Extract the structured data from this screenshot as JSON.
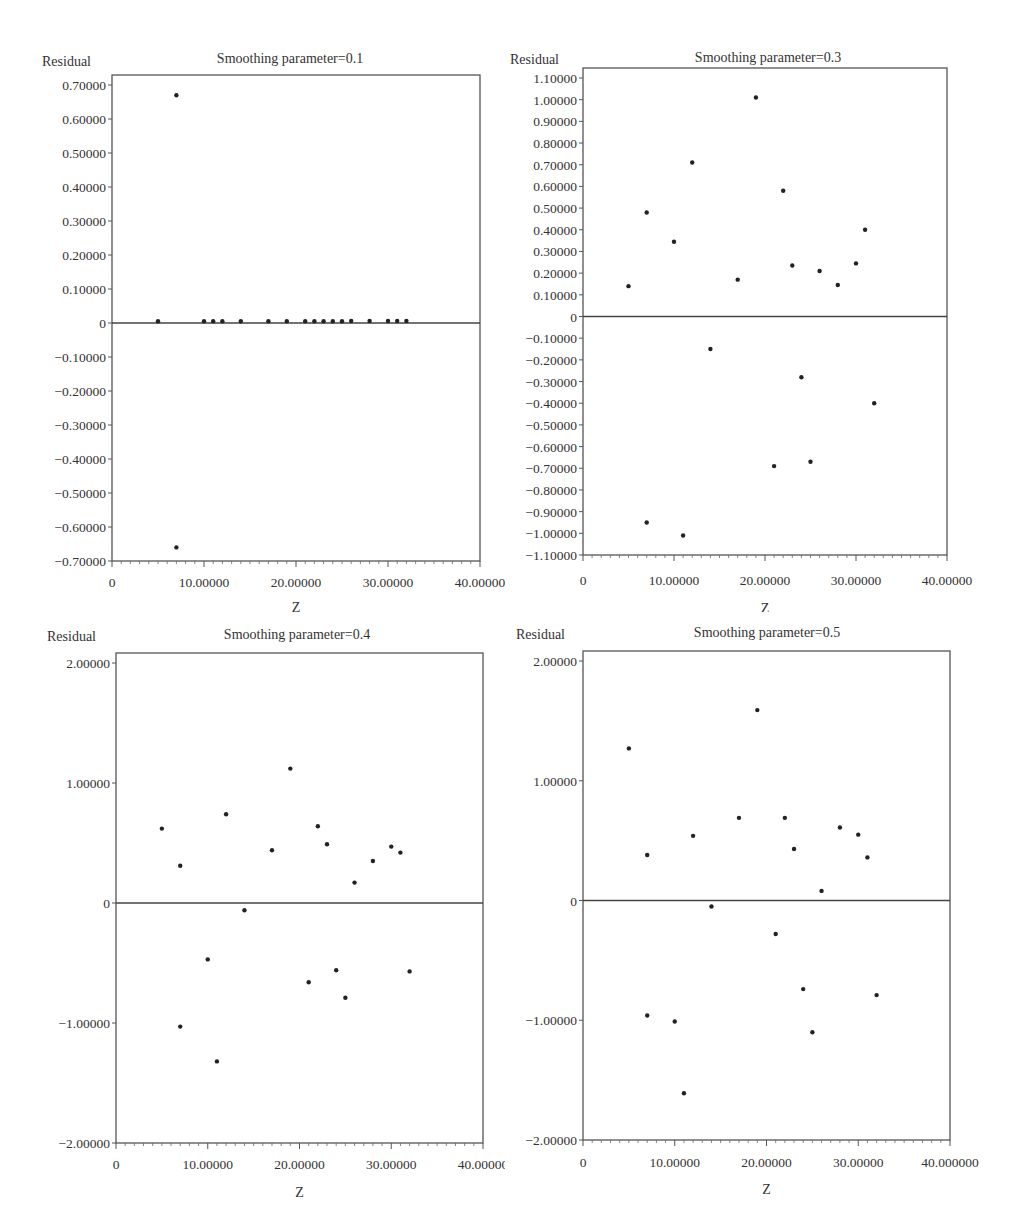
{
  "chart_data": [
    {
      "type": "scatter",
      "title": "Smoothing parameter=0.1",
      "xlabel": "Z",
      "ylabel": "Residual",
      "xlim": [
        0,
        40
      ],
      "ylim": [
        -0.7,
        0.7
      ],
      "xticks": [
        0,
        10,
        20,
        30,
        40
      ],
      "xtick_labels": [
        "0",
        "10.00000",
        "20.00000",
        "30.00000",
        "40.00000"
      ],
      "yticks": [
        0.7,
        0.6,
        0.5,
        0.4,
        0.3,
        0.2,
        0.1,
        0,
        -0.1,
        -0.2,
        -0.3,
        -0.4,
        -0.5,
        -0.6,
        -0.7
      ],
      "ytick_labels": [
        "0.70000",
        "0.60000",
        "0.50000",
        "0.40000",
        "0.30000",
        "0.20000",
        "0.10000",
        "0",
        "-0.10000",
        "-0.20000",
        "-0.30000",
        "-0.40000",
        "-0.50000",
        "-0.60000",
        "-0.70000"
      ],
      "reference_line": 0,
      "grid": false,
      "x": [
        5,
        7,
        7,
        10,
        11,
        12,
        14,
        17,
        19,
        21,
        22,
        23,
        24,
        25,
        26,
        28,
        30,
        31,
        32
      ],
      "y": [
        0.005,
        0.67,
        -0.66,
        0.005,
        0.005,
        0.005,
        0.005,
        0.005,
        0.005,
        0.005,
        0.005,
        0.005,
        0.005,
        0.005,
        0.006,
        0.006,
        0.006,
        0.006,
        0.006
      ]
    },
    {
      "type": "scatter",
      "title": "Smoothing parameter=0.3",
      "xlabel": "Z",
      "ylabel": "Residual",
      "xlim": [
        0,
        40
      ],
      "ylim": [
        -1.1,
        1.1
      ],
      "xticks": [
        0,
        10,
        20,
        30,
        40
      ],
      "xtick_labels": [
        "0",
        "10.00000",
        "20.00000",
        "30.00000",
        "40.00000"
      ],
      "yticks": [
        1.1,
        1.0,
        0.9,
        0.8,
        0.7,
        0.6,
        0.5,
        0.4,
        0.3,
        0.2,
        0.1,
        0,
        -0.1,
        -0.2,
        -0.3,
        -0.4,
        -0.5,
        -0.6,
        -0.7,
        -0.8,
        -0.9,
        -1.0,
        -1.1
      ],
      "ytick_labels": [
        "1.10000",
        "1.00000",
        "0.90000",
        "0.80000",
        "0.70000",
        "0.60000",
        "0.50000",
        "0.40000",
        "0.30000",
        "0.20000",
        "0.10000",
        "0",
        "-0.10000",
        "-0.20000",
        "-0.30000",
        "-0.40000",
        "-0.50000",
        "-0.60000",
        "-0.70000",
        "-0.80000",
        "-0.90000",
        "-1.00000",
        "-1.10000"
      ],
      "reference_line": 0,
      "grid": false,
      "x": [
        5,
        7,
        7,
        10,
        11,
        12,
        14,
        17,
        19,
        21,
        22,
        23,
        24,
        25,
        26,
        28,
        30,
        31,
        32
      ],
      "y": [
        0.14,
        0.48,
        -0.95,
        0.345,
        -1.01,
        0.71,
        -0.15,
        0.17,
        1.01,
        -0.69,
        0.58,
        0.235,
        -0.28,
        -0.67,
        0.21,
        0.145,
        0.245,
        0.4,
        -0.4
      ]
    },
    {
      "type": "scatter",
      "title": "Smoothing parameter=0.4",
      "xlabel": "Z",
      "ylabel": "Residual",
      "xlim": [
        0,
        40
      ],
      "ylim": [
        -2,
        2
      ],
      "xticks": [
        0,
        10,
        20,
        30,
        40
      ],
      "xtick_labels": [
        "0",
        "10.00000",
        "20.00000",
        "30.00000",
        "40.00000"
      ],
      "yticks": [
        2,
        1,
        0,
        -1,
        -2
      ],
      "ytick_labels": [
        "2.00000",
        "1.00000",
        "0",
        "-1.00000",
        "-2.00000"
      ],
      "reference_line": 0,
      "grid": false,
      "x": [
        5,
        7,
        7,
        10,
        11,
        12,
        14,
        17,
        19,
        21,
        22,
        23,
        24,
        25,
        26,
        28,
        30,
        31,
        32
      ],
      "y": [
        0.62,
        0.31,
        -1.03,
        -0.47,
        -1.32,
        0.74,
        -0.06,
        0.44,
        1.12,
        -0.66,
        0.64,
        0.49,
        -0.56,
        -0.79,
        0.17,
        0.35,
        0.47,
        0.42,
        -0.57
      ]
    },
    {
      "type": "scatter",
      "title": "Smoothing parameter=0.5",
      "xlabel": "Z",
      "ylabel": "Residual",
      "xlim": [
        0,
        40
      ],
      "ylim": [
        -2,
        2
      ],
      "xticks": [
        0,
        10,
        20,
        30,
        40
      ],
      "xtick_labels": [
        "0",
        "10.00000",
        "20.00000",
        "30.00000",
        "40.000000"
      ],
      "yticks": [
        2,
        1,
        0,
        -1,
        -2
      ],
      "ytick_labels": [
        "2.00000",
        "1.00000",
        "0",
        "-1.00000",
        "-2.00000"
      ],
      "reference_line": 0,
      "grid": false,
      "x": [
        5,
        7,
        7,
        10,
        11,
        12,
        14,
        17,
        19,
        21,
        22,
        23,
        24,
        25,
        26,
        28,
        30,
        31,
        32
      ],
      "y": [
        1.27,
        0.38,
        -0.96,
        -1.01,
        -1.61,
        0.54,
        -0.05,
        0.69,
        1.59,
        -0.28,
        0.69,
        0.43,
        -0.74,
        -1.1,
        0.08,
        0.61,
        0.55,
        0.36,
        -0.79
      ]
    }
  ]
}
